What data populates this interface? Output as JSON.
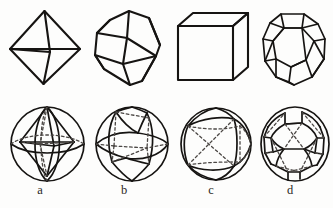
{
  "figure": {
    "background_color": "#fdfdfc",
    "line_color": "#161412",
    "hidden_line_color": "#4b4744",
    "rows": [
      {
        "row_name": "polyhedra",
        "description": "Row 1 — convex polyhedra drawn in perspective with visible edges only"
      },
      {
        "row_name": "spherical-projections",
        "description": "Row 2 — the same forms projected onto a sphere, hidden arcs dashed"
      }
    ],
    "columns": [
      {
        "label": "a",
        "top_shape_name": "octahedron",
        "bottom_shape_name": "spherical-octahedron",
        "faces": 8,
        "vertices": 6,
        "edges": 12,
        "face_type": "triangle"
      },
      {
        "label": "b",
        "top_shape_name": "rhombic-dodecahedron",
        "bottom_shape_name": "spherical-rhombic-dodecahedron",
        "faces": 12,
        "vertices": 14,
        "edges": 24,
        "face_type": "rhombus"
      },
      {
        "label": "c",
        "top_shape_name": "cube",
        "bottom_shape_name": "spherical-cube",
        "faces": 6,
        "vertices": 8,
        "edges": 12,
        "face_type": "square"
      },
      {
        "label": "d",
        "top_shape_name": "truncated-octahedron",
        "bottom_shape_name": "spherical-truncated-octahedron",
        "faces": 14,
        "vertices": 24,
        "edges": 36,
        "face_type": "square and hexagon"
      }
    ],
    "labels": {
      "a": "a",
      "b": "b",
      "c": "c",
      "d": "d"
    }
  }
}
